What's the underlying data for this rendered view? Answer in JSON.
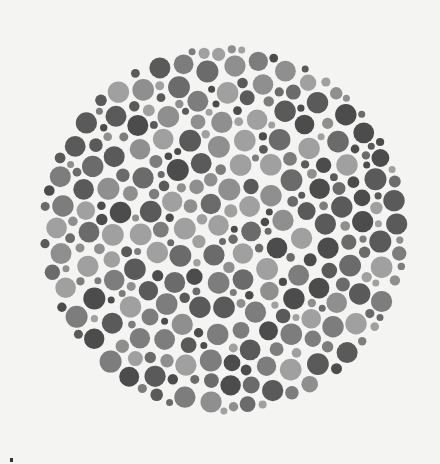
{
  "image": {
    "description": "Grayscale color-vision test plate (Ishihara-style) made of densely packed circular dots",
    "background_color": "#f4f4f3",
    "plate": {
      "center_x": 224,
      "center_y": 230,
      "radius": 185,
      "dot_gap": 1.6,
      "dot_radius_range": [
        3.5,
        11
      ],
      "palette": [
        "#5a5a5a",
        "#6b6b6b",
        "#7d7d7d",
        "#8f8f8f",
        "#a0a0a0",
        "#4c4c4c"
      ],
      "seed": 1337
    }
  }
}
